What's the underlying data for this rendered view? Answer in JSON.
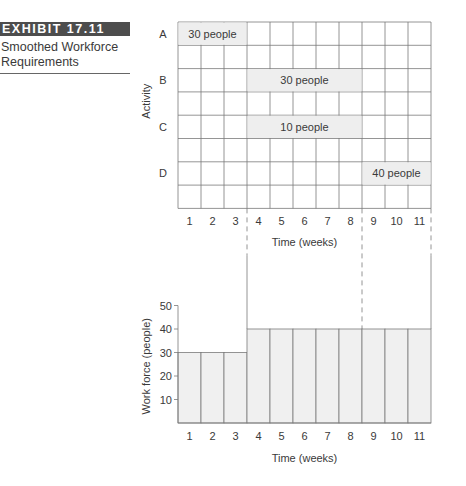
{
  "exhibit": {
    "label": "EXHIBIT 17.11",
    "title_line1": "Smoothed Workforce",
    "title_line2": "Requirements"
  },
  "chart_data": [
    {
      "type": "gantt",
      "title": "Activity schedule",
      "ylabel": "Activity",
      "xlabel": "Time (weeks)",
      "x_ticks": [
        "1",
        "2",
        "3",
        "4",
        "5",
        "6",
        "7",
        "8",
        "9",
        "10",
        "11"
      ],
      "activities": [
        {
          "name": "A",
          "start_week": 1,
          "end_week": 3,
          "label": "30 people",
          "workers": 30
        },
        {
          "name": "B",
          "start_week": 4,
          "end_week": 8,
          "label": "30 people",
          "workers": 30
        },
        {
          "name": "C",
          "start_week": 4,
          "end_week": 8,
          "label": "10 people",
          "workers": 10
        },
        {
          "name": "D",
          "start_week": 9,
          "end_week": 11,
          "label": "40 people",
          "workers": 40
        }
      ],
      "grid": true
    },
    {
      "type": "bar",
      "title": "Workforce load",
      "xlabel": "Time (weeks)",
      "ylabel": "Work force (people)",
      "categories": [
        "1",
        "2",
        "3",
        "4",
        "5",
        "6",
        "7",
        "8",
        "9",
        "10",
        "11"
      ],
      "values": [
        30,
        30,
        30,
        40,
        40,
        40,
        40,
        40,
        40,
        40,
        40
      ],
      "y_ticks": [
        "10",
        "20",
        "30",
        "40",
        "50"
      ],
      "ylim": [
        0,
        50
      ]
    }
  ]
}
